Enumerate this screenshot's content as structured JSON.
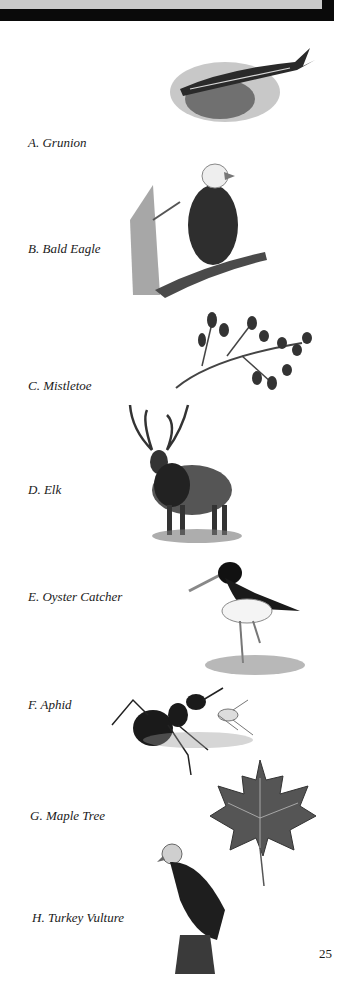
{
  "page": {
    "number": "25",
    "banner_color": "#c9c9c9",
    "banner_shadow_color": "#0a0a0a"
  },
  "items": [
    {
      "letter": "A",
      "label": "A. Grunion",
      "icon": "fish-illustration"
    },
    {
      "letter": "B",
      "label": "B. Bald Eagle",
      "icon": "eagle-illustration"
    },
    {
      "letter": "C",
      "label": "C. Mistletoe",
      "icon": "mistletoe-illustration"
    },
    {
      "letter": "D",
      "label": "D. Elk",
      "icon": "elk-illustration"
    },
    {
      "letter": "E",
      "label": "E. Oyster Catcher",
      "icon": "oystercatcher-illustration"
    },
    {
      "letter": "F",
      "label": "F. Aphid",
      "icon": "ant-aphid-illustration"
    },
    {
      "letter": "G",
      "label": "G. Maple Tree",
      "icon": "maple-leaf-illustration"
    },
    {
      "letter": "H",
      "label": "H. Turkey Vulture",
      "icon": "vulture-illustration"
    }
  ]
}
